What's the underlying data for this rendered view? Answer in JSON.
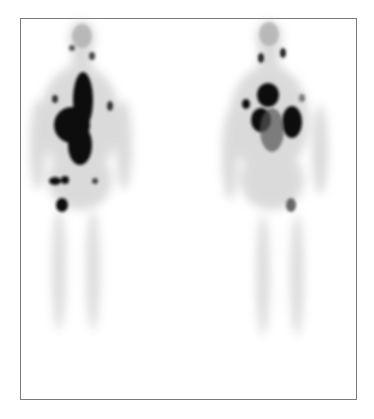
{
  "figure": {
    "type": "whole-body scintigraphy",
    "views": [
      {
        "name": "anterior",
        "position": "left"
      },
      {
        "name": "posterior",
        "position": "right"
      }
    ],
    "colors": {
      "background": "#ffffff",
      "border": "#7a7a7a",
      "uptake": "#111111"
    }
  }
}
